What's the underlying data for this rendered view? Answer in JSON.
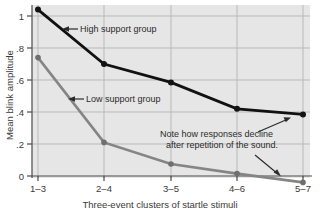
{
  "chart_data": {
    "type": "line",
    "title": "",
    "xlabel": "Three-event clusters of startle stimuli",
    "ylabel": "Mean blink amplitude",
    "categories": [
      "1–3",
      "2–4",
      "3–5",
      "4–6",
      "5–7"
    ],
    "series": [
      {
        "name": "High support group",
        "color": "#111111",
        "values": [
          1.04,
          0.7,
          0.585,
          0.42,
          0.385
        ]
      },
      {
        "name": "Low support group",
        "color": "#858585",
        "values": [
          0.74,
          0.21,
          0.075,
          0.015,
          -0.04
        ]
      }
    ],
    "yticks": [
      "0",
      ".2",
      ".4",
      ".6",
      ".8",
      "1"
    ],
    "ytick_values": [
      0,
      0.2,
      0.4,
      0.6,
      0.8,
      1.0
    ],
    "ylim": [
      -0.06,
      1.08
    ],
    "xlim": [
      0,
      4
    ],
    "grid": true,
    "legend": "none",
    "annotations": [
      {
        "id": "high-support-annotation",
        "text": "High support group",
        "arrow": "left"
      },
      {
        "id": "low-support-annotation",
        "text": "Low support group",
        "arrow": "left"
      },
      {
        "id": "decline-note",
        "line1": "Note how responses decline",
        "line2": "after repetition of the sound.",
        "arrow": "up-right-and-down-right"
      }
    ]
  },
  "figure": {
    "plot_background": "#e6e6e6",
    "page_background": "#ffffff",
    "gridline_color": "#b9b9b9",
    "axis_color": "#4a4a4a"
  }
}
